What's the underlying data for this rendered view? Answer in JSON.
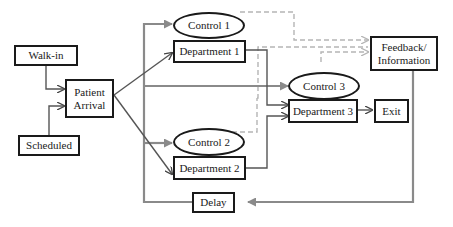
{
  "diagram": {
    "nodes": {
      "walkin": "Walk-in",
      "scheduled": "Scheduled",
      "patient_arrival_line1": "Patient",
      "patient_arrival_line2": "Arrival",
      "control1": "Control 1",
      "department1": "Department 1",
      "control2": "Control 2",
      "department2": "Department 2",
      "control3": "Control 3",
      "department3": "Department 3",
      "exit": "Exit",
      "feedback_line1": "Feedback/",
      "feedback_line2": "Information",
      "delay": "Delay"
    },
    "colors": {
      "box_border": "#1a1a1a",
      "solid_flow": "#555555",
      "gray_flow": "#8a8a8a",
      "dashed_feedback": "#b5b5b5"
    },
    "edges": [
      {
        "from": "Walk-in",
        "to": "Patient Arrival",
        "style": "solid"
      },
      {
        "from": "Scheduled",
        "to": "Patient Arrival",
        "style": "solid"
      },
      {
        "from": "Patient Arrival",
        "to": "Department 1",
        "style": "solid"
      },
      {
        "from": "Patient Arrival",
        "to": "Department 2",
        "style": "solid"
      },
      {
        "from": "Delay",
        "to": "Control 1",
        "style": "gray"
      },
      {
        "from": "Delay",
        "to": "Control 3",
        "style": "gray"
      },
      {
        "from": "Delay",
        "to": "Control 2",
        "style": "gray"
      },
      {
        "from": "Department 1",
        "to": "Department 3",
        "style": "solid"
      },
      {
        "from": "Department 2",
        "to": "Department 3",
        "style": "solid"
      },
      {
        "from": "Department 3",
        "to": "Exit",
        "style": "solid"
      },
      {
        "from": "Control 1",
        "to": "Feedback/Information",
        "style": "dashed"
      },
      {
        "from": "Control 2",
        "to": "Feedback/Information",
        "style": "dashed"
      },
      {
        "from": "Control 3",
        "to": "Feedback/Information",
        "style": "dashed"
      },
      {
        "from": "Feedback/Information",
        "to": "Delay",
        "style": "gray"
      }
    ]
  }
}
